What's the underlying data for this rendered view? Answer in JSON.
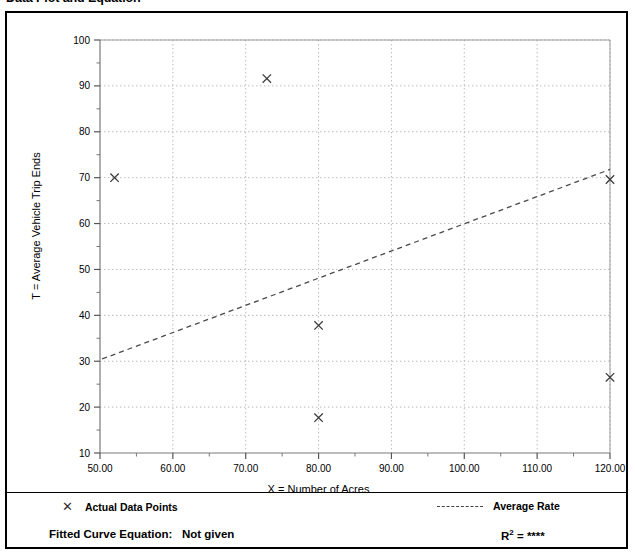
{
  "page": {
    "title": "Data Plot and Equation"
  },
  "chart_data": {
    "type": "scatter",
    "title": "Data Plot and Equation",
    "xlabel": "X = Number of Acres",
    "ylabel": "T = Average Vehicle Trip Ends",
    "xlim": [
      50,
      120
    ],
    "ylim": [
      10,
      100
    ],
    "xticks": [
      50,
      60,
      70,
      80,
      90,
      100,
      110,
      120
    ],
    "xtick_labels": [
      "50.00",
      "60.00",
      "70.00",
      "80.00",
      "90.00",
      "100.00",
      "110.00",
      "120.00"
    ],
    "yticks": [
      10,
      20,
      30,
      40,
      50,
      60,
      70,
      80,
      90,
      100
    ],
    "ytick_labels": [
      "10",
      "20",
      "30",
      "40",
      "50",
      "60",
      "70",
      "80",
      "90",
      "100"
    ],
    "minor_tick_step_x": 5,
    "minor_tick_step_y": 5,
    "grid": true,
    "grid_style": "dotted",
    "legend_position": "below-plot",
    "series": [
      {
        "name": "Actual Data Points",
        "type": "scatter",
        "marker": "x",
        "points": [
          {
            "x": 52.0,
            "y": 70.0
          },
          {
            "x": 72.9,
            "y": 91.6
          },
          {
            "x": 80.0,
            "y": 37.8
          },
          {
            "x": 80.0,
            "y": 17.7
          },
          {
            "x": 120.0,
            "y": 69.6
          },
          {
            "x": 120.0,
            "y": 26.5
          }
        ]
      },
      {
        "name": "Average Rate",
        "type": "line",
        "style": "dashed",
        "endpoints": [
          {
            "x": 50.3,
            "y": 30.5
          },
          {
            "x": 120.0,
            "y": 71.8
          }
        ]
      }
    ],
    "annotations": {
      "fitted_curve_equation": "Not given",
      "r_squared": "****"
    }
  },
  "legend": {
    "data_points_marker": "x-marker-icon",
    "data_points_label": "Actual Data Points",
    "average_rate_marker": "dashed-line-icon",
    "average_rate_label": "Average Rate"
  },
  "footer": {
    "equation_label": "Fitted Curve Equation:",
    "equation_value": "Not given",
    "r2_label": "R",
    "r2_exponent": "2",
    "r2_equals": "=",
    "r2_value": "****"
  }
}
